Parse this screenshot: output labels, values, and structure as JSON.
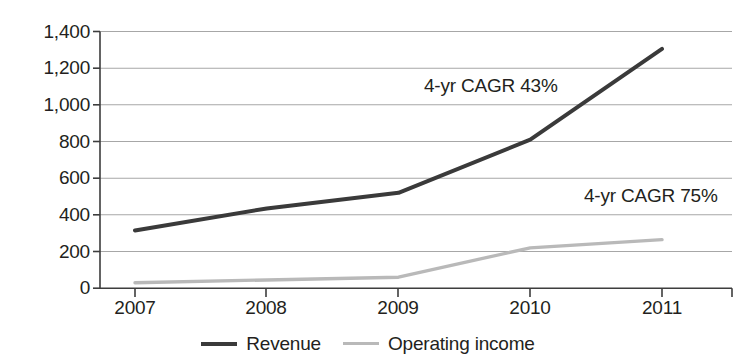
{
  "chart_data": {
    "type": "line",
    "title": "",
    "xlabel": "",
    "ylabel": "",
    "x": [
      "2007",
      "2008",
      "2009",
      "2010",
      "2011"
    ],
    "categories": [
      "2007",
      "2008",
      "2009",
      "2010",
      "2011"
    ],
    "series": [
      {
        "name": "Revenue",
        "color": "#3a3a3a",
        "values": [
          315,
          435,
          520,
          810,
          1305
        ]
      },
      {
        "name": "Operating income",
        "color": "#b9b9b9",
        "values": [
          30,
          45,
          60,
          220,
          265
        ]
      }
    ],
    "ylim": [
      0,
      1400
    ],
    "yticks": [
      0,
      200,
      400,
      600,
      800,
      1000,
      1200,
      1400
    ],
    "ytick_labels": [
      "0",
      "200",
      "400",
      "600",
      "800",
      "1,000",
      "1,200",
      "1,400"
    ],
    "grid": true,
    "legend_position": "bottom",
    "annotations": [
      {
        "text": "4-yr CAGR 43%",
        "series": "Revenue"
      },
      {
        "text": "4-yr CAGR 75%",
        "series": "Operating income"
      }
    ]
  },
  "legend": {
    "items": [
      {
        "label": "Revenue"
      },
      {
        "label": "Operating income"
      }
    ]
  },
  "colors": {
    "revenue": "#3a3a3a",
    "operating_income": "#b9b9b9",
    "grid": "#a7a7a7",
    "axis": "#3d3d3d",
    "text": "#231f20",
    "background": "#ffffff"
  }
}
